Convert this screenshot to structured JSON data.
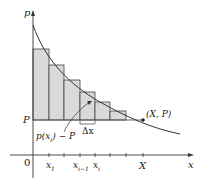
{
  "labels": {
    "y_axis": "p",
    "x_axis": "x",
    "origin": "0",
    "P_level": "P",
    "point": "(X, P)",
    "delta_x": "Δx",
    "height_label": "p(x",
    "height_sub": "i",
    "height_tail": ") − P",
    "ticks": {
      "x1": "x",
      "x1_sub": "1",
      "xim1": "x",
      "xim1_sub": "i−1",
      "xi": "x",
      "xi_sub": "i",
      "X": "X"
    }
  },
  "colors": {
    "fill": "#d9d9d9",
    "stroke": "#333333"
  }
}
